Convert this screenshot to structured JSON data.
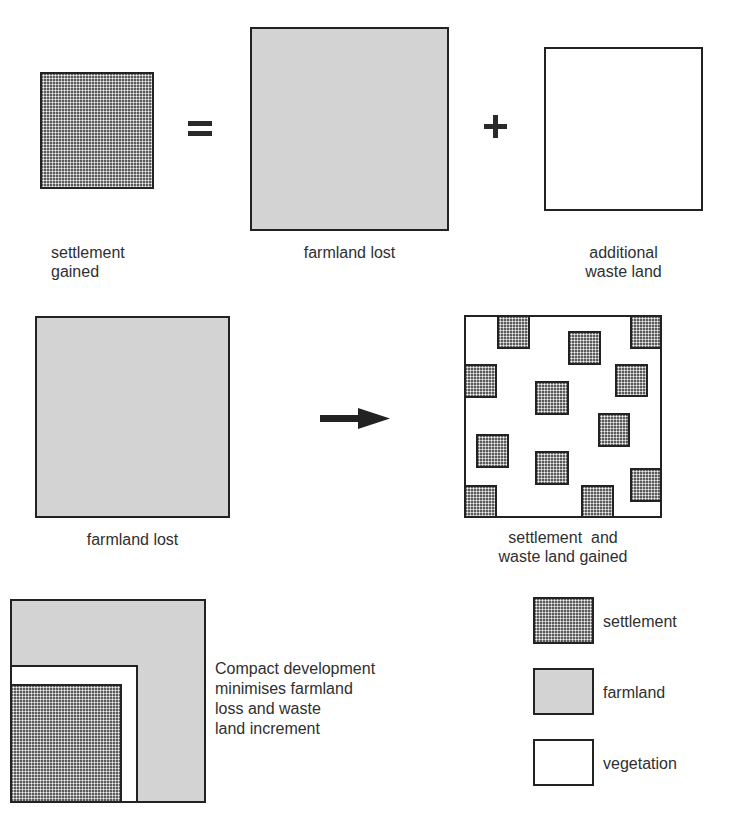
{
  "row1": {
    "settlement_gained": "settlement\ngained",
    "settlement_gained_l1": "settlement",
    "settlement_gained_l2": "gained",
    "equals_symbol": "=",
    "farmland_lost": "farmland lost",
    "plus_symbol": "+",
    "additional_waste_l1": "additional",
    "additional_waste_l2": "waste land"
  },
  "row2": {
    "farmland_lost": "farmland lost",
    "arrow": "right-arrow",
    "result_l1": "settlement  and",
    "result_l2": "waste land gained",
    "scattered_settlements": [
      {
        "x": 33,
        "y": 0,
        "w": 33,
        "h": 34
      },
      {
        "x": 104,
        "y": 16,
        "w": 33,
        "h": 34
      },
      {
        "x": 166,
        "y": 0,
        "w": 31,
        "h": 34
      },
      {
        "x": 0,
        "y": 49,
        "w": 33,
        "h": 34
      },
      {
        "x": 151,
        "y": 49,
        "w": 33,
        "h": 33
      },
      {
        "x": 71,
        "y": 66,
        "w": 34,
        "h": 34
      },
      {
        "x": 134,
        "y": 98,
        "w": 32,
        "h": 34
      },
      {
        "x": 12,
        "y": 119,
        "w": 33,
        "h": 34
      },
      {
        "x": 71,
        "y": 136,
        "w": 34,
        "h": 34
      },
      {
        "x": 166,
        "y": 153,
        "w": 31,
        "h": 34
      },
      {
        "x": 0,
        "y": 170,
        "w": 33,
        "h": 32
      },
      {
        "x": 117,
        "y": 170,
        "w": 33,
        "h": 32
      }
    ]
  },
  "row3": {
    "caption_l1": "Compact development",
    "caption_l2": "minimises farmland",
    "caption_l3": "loss and waste",
    "caption_l4": "land increment"
  },
  "legend": {
    "items": [
      {
        "label": "settlement",
        "pattern": "dense-crosshatch"
      },
      {
        "label": "farmland",
        "pattern": "light-stipple"
      },
      {
        "label": "vegetation",
        "pattern": "blank"
      }
    ]
  },
  "colors": {
    "outline": "#222222",
    "farmland_fill": "#dcdcdc",
    "settlement_fill": "#9a9a9a",
    "vegetation_fill": "#ffffff",
    "text": "#2f2f2f"
  }
}
